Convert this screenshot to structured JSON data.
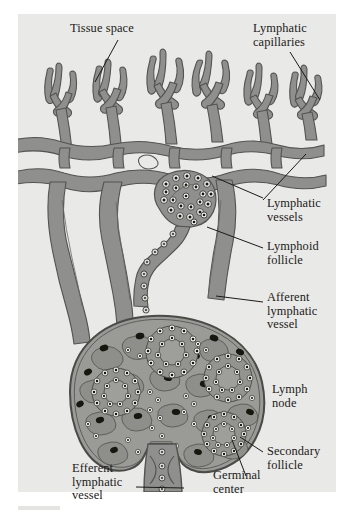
{
  "figure": {
    "panel_bg": "#e9e9e7",
    "page_bg": "#ffffff",
    "vessel_fill": "#8f8f8d",
    "vessel_stroke": "#53534f",
    "node_cortex_fill": "#9a9a97",
    "node_stroke": "#4a4a46",
    "cell_dark": "#17170f",
    "cell_light": "#f4f4f0",
    "label_color": "#1a1a18",
    "leader_color": "#1a1a18"
  },
  "labels": [
    {
      "id": "tissue-space",
      "text": "Tissue space",
      "lines": [
        "Tissue space"
      ],
      "x": 70,
      "y": 22
    },
    {
      "id": "lymphatic-capillaries",
      "text": "Lymphatic capillaries",
      "lines": [
        "Lymphatic",
        "capillaries"
      ],
      "x": 253,
      "y": 22
    },
    {
      "id": "lymphatic-vessels",
      "text": "Lymphatic vessels",
      "lines": [
        "Lymphatic",
        "vessels"
      ],
      "x": 267,
      "y": 200
    },
    {
      "id": "lymphoid-follicle",
      "text": "Lymphoid follicle",
      "lines": [
        "Lymphoid",
        "follicle"
      ],
      "x": 267,
      "y": 242
    },
    {
      "id": "afferent-lymphatic-vessel",
      "text": "Afferent lymphatic vessel",
      "lines": [
        "Afferent",
        "lymphatic",
        "vessel"
      ],
      "x": 267,
      "y": 293
    },
    {
      "id": "lymph-node",
      "text": "Lymph node",
      "lines": [
        "Lymph",
        "node"
      ],
      "x": 272,
      "y": 386
    },
    {
      "id": "secondary-follicle",
      "text": "Secondary follicle",
      "lines": [
        "Secondary",
        "follicle"
      ],
      "x": 267,
      "y": 447
    },
    {
      "id": "germinal-center",
      "text": "Germinal center",
      "lines": [
        "Germinal",
        "center"
      ],
      "x": 213,
      "y": 482
    },
    {
      "id": "efferent-lymphatic-vessel",
      "text": "Efferent lymphatic vessel",
      "lines": [
        "Efferent",
        "lymphatic",
        "vessel"
      ],
      "x": 72,
      "y": 466
    }
  ],
  "leaders": [
    {
      "id": "leader-tissue-space",
      "x1": 118,
      "y1": 40,
      "x2": 95,
      "y2": 80
    },
    {
      "id": "leader-lymphatic-capillaries",
      "x1": 290,
      "y1": 52,
      "x2": 318,
      "y2": 96
    },
    {
      "id": "leader-lymphatic-vessels-a",
      "x1": 263,
      "y1": 200,
      "x2": 212,
      "y2": 176
    },
    {
      "id": "leader-lymphatic-vessels-b",
      "x1": 263,
      "y1": 203,
      "x2": 305,
      "y2": 156
    },
    {
      "id": "leader-lymphoid-follicle",
      "x1": 263,
      "y1": 248,
      "x2": 206,
      "y2": 228
    },
    {
      "id": "leader-afferent-vessel",
      "x1": 263,
      "y1": 302,
      "x2": 213,
      "y2": 296
    },
    {
      "id": "leader-secondary-follicle",
      "x1": 263,
      "y1": 452,
      "x2": 239,
      "y2": 438
    },
    {
      "id": "leader-germinal-center",
      "x1": 245,
      "y1": 478,
      "x2": 233,
      "y2": 440
    },
    {
      "id": "leader-efferent-vessel",
      "x1": 136,
      "y1": 487,
      "x2": 186,
      "y2": 489
    }
  ],
  "structures": {
    "capillary_network": "branching lymphatic capillary plexus with blind-ended finger-like tufts",
    "follicle": "lymphoid follicle on a stalk above the node",
    "node": "bean-shaped lymph node with cortex, follicles and germinal centers",
    "afferent": "afferent lymphatic vessels entering the node from above",
    "efferent": "efferent lymphatic vessel leaving the node at the hilum"
  }
}
